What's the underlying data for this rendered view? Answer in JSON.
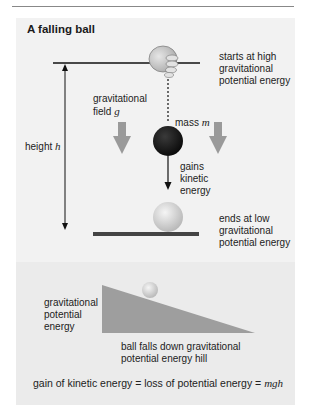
{
  "header": {
    "partial_text": "...physics of falling objects and energy"
  },
  "diagram": {
    "title": "A falling ball",
    "start_label": [
      "starts at high",
      "gravitational",
      "potential energy"
    ],
    "field_label": [
      "gravitational",
      "field"
    ],
    "field_symbol": "g",
    "mass_label": "mass",
    "mass_symbol": "m",
    "height_label": "height",
    "height_symbol": "h",
    "kinetic_label": [
      "gains",
      "kinetic",
      "energy"
    ],
    "end_label": [
      "ends at low",
      "gravitational",
      "potential energy"
    ]
  },
  "hill": {
    "gpe_label": [
      "gravitational",
      "potential",
      "energy"
    ],
    "caption": [
      "ball falls down gravitational",
      "potential energy hill"
    ]
  },
  "equation": {
    "text": "gain of kinetic energy = loss of potential energy = ",
    "symbol": "mgh"
  },
  "colors": {
    "panel_bg": "#f2f2f2",
    "lower_panel_bg": "#ebebeb",
    "field_arrow": "#9a9a9a",
    "hill": "#9e9e9e",
    "ball_dark": "#111111",
    "ground": "#444444"
  }
}
